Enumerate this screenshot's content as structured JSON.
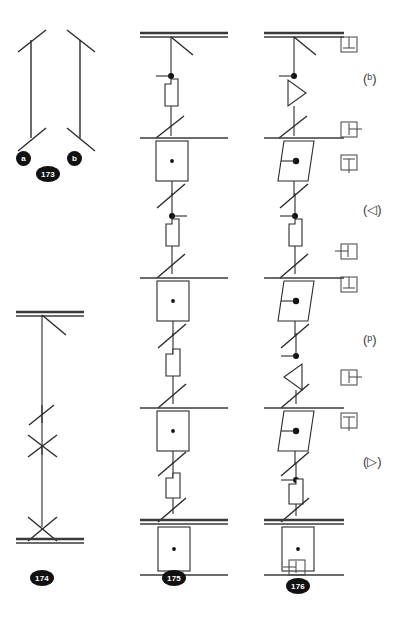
{
  "sheet": {
    "background": "#ffffff",
    "ink": "#2b2b2b",
    "badge_fill": "#111111",
    "badge_text": "#ffffff",
    "width": 404,
    "height": 634
  },
  "figures": [
    {
      "id": "fig-173",
      "number": "173",
      "terminals": [
        {
          "id": "terminal-a",
          "label": "a"
        },
        {
          "id": "terminal-b",
          "label": "b"
        }
      ]
    },
    {
      "id": "fig-174",
      "number": "174"
    },
    {
      "id": "fig-175",
      "number": "175"
    },
    {
      "id": "fig-176",
      "number": "176"
    }
  ],
  "annotations": {
    "boxed": [
      {
        "id": "anno-box-1",
        "glyph": "box-with-stem-down"
      },
      {
        "id": "anno-box-2",
        "glyph": "box-with-stem-left"
      },
      {
        "id": "anno-box-3",
        "glyph": "box-with-stem-up"
      },
      {
        "id": "anno-box-4",
        "glyph": "box-with-stem-left"
      },
      {
        "id": "anno-box-5",
        "glyph": "box-with-stem-down"
      },
      {
        "id": "anno-box-6",
        "glyph": "box-with-stem-left"
      },
      {
        "id": "anno-box-7",
        "glyph": "box-with-stem-up"
      },
      {
        "id": "anno-box-8",
        "glyph": "box-with-stem-left"
      }
    ],
    "parenthesized": [
      {
        "id": "anno-paren-1",
        "text": "(ᵇ)"
      },
      {
        "id": "anno-paren-2",
        "text": "(◁)"
      },
      {
        "id": "anno-paren-3",
        "text": "(ᵖ)"
      },
      {
        "id": "anno-paren-4",
        "text": "(▷)"
      }
    ]
  }
}
